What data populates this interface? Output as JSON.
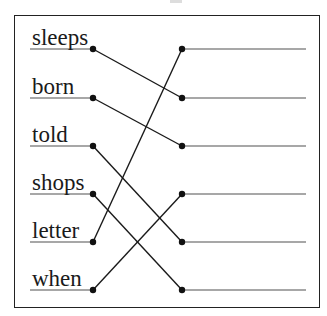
{
  "diagram": {
    "type": "matching-exercise",
    "left_words": [
      "sleeps",
      "born",
      "told",
      "shops",
      "letter",
      "when"
    ],
    "row_y": [
      49,
      98,
      146,
      194,
      242,
      290
    ],
    "left_dot_x": 93,
    "right_dot_x": 182,
    "left_line_start_x": 30,
    "right_line_end_x": 306,
    "connections": [
      {
        "from": 0,
        "to": 1
      },
      {
        "from": 1,
        "to": 2
      },
      {
        "from": 2,
        "to": 4
      },
      {
        "from": 3,
        "to": 5
      },
      {
        "from": 4,
        "to": 0
      },
      {
        "from": 5,
        "to": 3
      }
    ],
    "colors": {
      "line": "#1a1a1a",
      "underline": "#8a8a8a",
      "dot": "#111111",
      "frame": "#222222"
    }
  }
}
